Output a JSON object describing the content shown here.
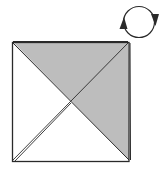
{
  "diagram": {
    "type": "origami-step",
    "colors": {
      "background": "#ffffff",
      "shade": "#bdbdbd",
      "line": "#2a2a2a"
    },
    "square": {
      "x1": 12,
      "y1": 42,
      "x2": 129,
      "y2": 161
    },
    "symbols": [
      {
        "name": "turn-over-arrow",
        "cx": 139,
        "cy": 22,
        "r": 16
      }
    ]
  }
}
